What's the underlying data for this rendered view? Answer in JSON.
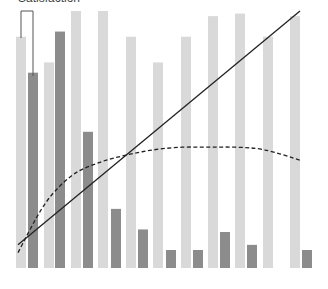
{
  "chart_data": {
    "type": "bar",
    "title": "Satisfaction",
    "xlabel": "",
    "ylabel": "",
    "ylim": [
      0,
      100
    ],
    "grid": false,
    "legend": "none",
    "categories": [
      "1",
      "2",
      "3",
      "4",
      "5",
      "6",
      "7",
      "8",
      "9",
      "10",
      "11"
    ],
    "series": [
      {
        "name": "light",
        "kind": "bar",
        "color": "#d9d9d9",
        "values": [
          90,
          80,
          100,
          100,
          90,
          80,
          90,
          98,
          99,
          90,
          98
        ]
      },
      {
        "name": "dark",
        "kind": "bar",
        "color": "#8c8c8c",
        "values": [
          76,
          92,
          53,
          23,
          15,
          7,
          7,
          14,
          9,
          null,
          7
        ]
      },
      {
        "name": "cumulative-line",
        "kind": "line",
        "style": "solid",
        "color": "#222222",
        "x_start_px": 18,
        "y_start_value": 9,
        "x_end_px": 300,
        "y_end_value": 100
      },
      {
        "name": "trend-curve",
        "kind": "line",
        "style": "dashed",
        "color": "#222222",
        "values_approx": [
          6,
          25,
          36,
          41,
          44,
          46,
          47,
          47,
          47,
          46,
          42
        ]
      }
    ],
    "annotations": [
      {
        "type": "bracket",
        "text": "",
        "over_category": "1"
      }
    ]
  }
}
